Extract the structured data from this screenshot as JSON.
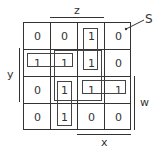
{
  "title_label": "S",
  "variables": {
    "top": "z",
    "left": "y",
    "right": "w",
    "bottom": "x"
  },
  "kmap": [
    [
      "0",
      "0",
      "1",
      "0"
    ],
    [
      "1",
      "1",
      "1",
      "0"
    ],
    [
      "0",
      "1",
      "1",
      "1"
    ],
    [
      "0",
      "1",
      "0",
      "0"
    ]
  ],
  "groups": [
    {
      "name": "row2-col1-2",
      "cells": [
        [
          1,
          0
        ],
        [
          1,
          1
        ]
      ]
    },
    {
      "name": "square-rows2-3-cols2-3",
      "cells": [
        [
          1,
          1
        ],
        [
          1,
          2
        ],
        [
          2,
          1
        ],
        [
          2,
          2
        ]
      ]
    },
    {
      "name": "col3-rows1-2",
      "cells": [
        [
          0,
          2
        ],
        [
          1,
          2
        ]
      ]
    },
    {
      "name": "row3-col3-4",
      "cells": [
        [
          2,
          2
        ],
        [
          2,
          3
        ]
      ]
    },
    {
      "name": "col2-rows3-4",
      "cells": [
        [
          2,
          1
        ],
        [
          3,
          1
        ]
      ]
    }
  ]
}
